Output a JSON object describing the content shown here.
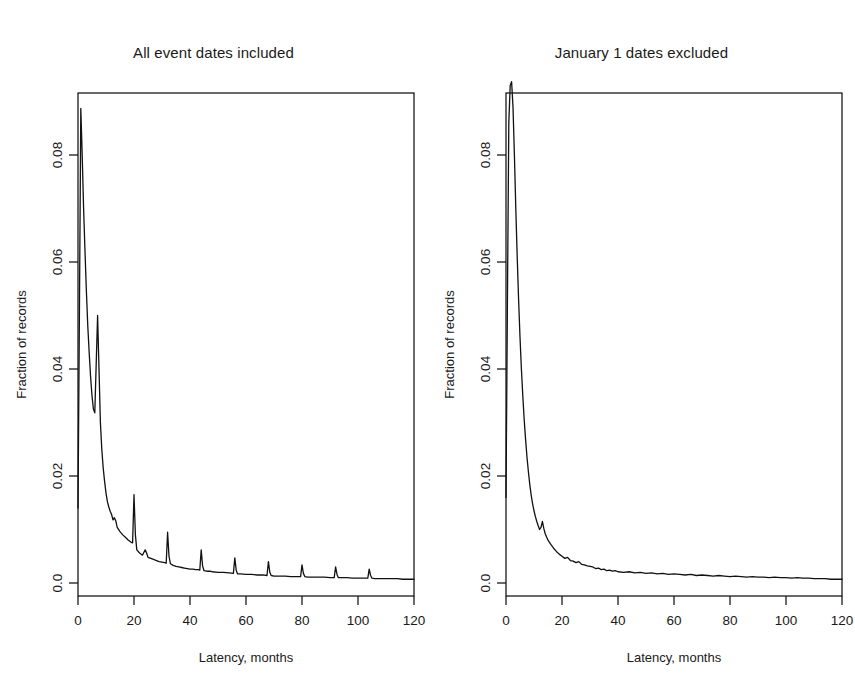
{
  "figure": {
    "background": "#ffffff",
    "line_color": "#111111",
    "text_color": "#1a1a1a"
  },
  "chart_data": [
    {
      "type": "line",
      "title": "All event dates included",
      "xlabel": "Latency, months",
      "ylabel": "Fraction of records",
      "xlim": [
        0,
        120
      ],
      "ylim": [
        0.0,
        0.095
      ],
      "xticks": [
        0,
        20,
        40,
        60,
        80,
        100,
        120
      ],
      "xticklabels": [
        "0",
        "20",
        "40",
        "60",
        "80",
        "100",
        "120"
      ],
      "yticks": [
        0.0,
        0.02,
        0.04,
        0.06,
        0.08
      ],
      "yticklabels": [
        "0.0",
        "0.02",
        "0.04",
        "0.06",
        "0.08"
      ],
      "grid": false,
      "legend": false,
      "legend_position": "none",
      "x": [
        0,
        0.5,
        1,
        1.5,
        2,
        2.5,
        3,
        3.5,
        4,
        4.5,
        5,
        5.5,
        6,
        6.5,
        7,
        7.5,
        8,
        8.5,
        9,
        9.5,
        10,
        10.5,
        11,
        11.5,
        12,
        12.5,
        13,
        13.5,
        14,
        15,
        16,
        17,
        18,
        19,
        19.5,
        20,
        20.5,
        21,
        22,
        23,
        24,
        24.5,
        25,
        26,
        27,
        28,
        29,
        30,
        31,
        31.5,
        32,
        32.5,
        33,
        34,
        35,
        36,
        37,
        38,
        39,
        40,
        41,
        42,
        43,
        43.5,
        44,
        44.5,
        45,
        46,
        47,
        48,
        50,
        52,
        54,
        55.5,
        56,
        56.5,
        57,
        58,
        60,
        62,
        64,
        66,
        67.5,
        68,
        68.5,
        69,
        70,
        72,
        74,
        76,
        78,
        79.5,
        80,
        80.5,
        81,
        82,
        84,
        86,
        88,
        90,
        91.5,
        92,
        92.5,
        93,
        94,
        96,
        98,
        100,
        103.5,
        104,
        104.5,
        105,
        106,
        108,
        110,
        112,
        114,
        116,
        118,
        120
      ],
      "y": [
        0.014,
        0.05,
        0.0887,
        0.08,
        0.07,
        0.062,
        0.0545,
        0.048,
        0.043,
        0.0385,
        0.035,
        0.0325,
        0.0318,
        0.041,
        0.05,
        0.04,
        0.03,
        0.025,
        0.0215,
        0.019,
        0.0168,
        0.0152,
        0.0142,
        0.0134,
        0.0128,
        0.0118,
        0.0122,
        0.0116,
        0.0104,
        0.0096,
        0.009,
        0.0085,
        0.008,
        0.0076,
        0.0075,
        0.0165,
        0.009,
        0.0062,
        0.0056,
        0.0052,
        0.0062,
        0.0056,
        0.0048,
        0.0046,
        0.0044,
        0.0042,
        0.004,
        0.0039,
        0.0038,
        0.0037,
        0.0095,
        0.005,
        0.0036,
        0.0033,
        0.0031,
        0.003,
        0.0029,
        0.0028,
        0.0027,
        0.0026,
        0.0026,
        0.0025,
        0.0025,
        0.0024,
        0.0062,
        0.0032,
        0.0023,
        0.0022,
        0.0022,
        0.0021,
        0.002,
        0.002,
        0.0019,
        0.0018,
        0.0047,
        0.0024,
        0.0017,
        0.0017,
        0.0016,
        0.0016,
        0.0015,
        0.0015,
        0.0014,
        0.004,
        0.002,
        0.0014,
        0.0013,
        0.0013,
        0.0013,
        0.0012,
        0.0012,
        0.0012,
        0.0034,
        0.0018,
        0.0012,
        0.0011,
        0.0011,
        0.0011,
        0.0011,
        0.001,
        0.001,
        0.003,
        0.0016,
        0.001,
        0.001,
        0.001,
        0.0009,
        0.0009,
        0.0009,
        0.0026,
        0.0014,
        0.0009,
        0.0008,
        0.0008,
        0.0008,
        0.0008,
        0.0008,
        0.0007,
        0.0007,
        0.0007
      ]
    },
    {
      "type": "line",
      "title": "January 1 dates excluded",
      "xlabel": "Latency, months",
      "ylabel": "Fraction of records",
      "xlim": [
        0,
        120
      ],
      "ylim": [
        0.0,
        0.095
      ],
      "xticks": [
        0,
        20,
        40,
        60,
        80,
        100,
        120
      ],
      "xticklabels": [
        "0",
        "20",
        "40",
        "60",
        "80",
        "100",
        "120"
      ],
      "yticks": [
        0.0,
        0.02,
        0.04,
        0.06,
        0.08
      ],
      "yticklabels": [
        "0.0",
        "0.02",
        "0.04",
        "0.06",
        "0.08"
      ],
      "grid": false,
      "legend": false,
      "legend_position": "none",
      "x": [
        0,
        0.5,
        1,
        1.5,
        2,
        2.5,
        3,
        3.5,
        4,
        4.5,
        5,
        5.5,
        6,
        6.5,
        7,
        7.5,
        8,
        8.5,
        9,
        9.5,
        10,
        10.5,
        11,
        11.5,
        12,
        12.5,
        13,
        13.5,
        14,
        14.5,
        15,
        16,
        17,
        18,
        19,
        20,
        21,
        22,
        23,
        24,
        25,
        26,
        27,
        28,
        29,
        30,
        31,
        32,
        33,
        34,
        35,
        36,
        37,
        38,
        39,
        40,
        42,
        44,
        46,
        48,
        50,
        52,
        54,
        56,
        58,
        60,
        62,
        64,
        66,
        68,
        70,
        72,
        74,
        76,
        78,
        80,
        82,
        84,
        86,
        88,
        90,
        92,
        94,
        96,
        98,
        100,
        102,
        104,
        106,
        108,
        110,
        112,
        114,
        116,
        118,
        120
      ],
      "y": [
        0.016,
        0.052,
        0.086,
        0.093,
        0.0937,
        0.089,
        0.08,
        0.07,
        0.061,
        0.053,
        0.046,
        0.04,
        0.035,
        0.0305,
        0.0268,
        0.0235,
        0.0208,
        0.0184,
        0.0164,
        0.0148,
        0.0135,
        0.0124,
        0.0115,
        0.0107,
        0.01,
        0.0104,
        0.0115,
        0.0102,
        0.0092,
        0.0086,
        0.008,
        0.0072,
        0.0065,
        0.0059,
        0.0054,
        0.005,
        0.0046,
        0.0048,
        0.0042,
        0.0041,
        0.0038,
        0.004,
        0.0035,
        0.0034,
        0.0032,
        0.0031,
        0.003,
        0.0027,
        0.0028,
        0.0025,
        0.0026,
        0.0023,
        0.0024,
        0.0022,
        0.0023,
        0.0021,
        0.002,
        0.0021,
        0.0019,
        0.002,
        0.0018,
        0.0019,
        0.0017,
        0.0018,
        0.0016,
        0.0017,
        0.0016,
        0.0015,
        0.0016,
        0.0014,
        0.0015,
        0.0014,
        0.0013,
        0.0014,
        0.0013,
        0.0012,
        0.0013,
        0.0012,
        0.0011,
        0.0012,
        0.0011,
        0.0011,
        0.001,
        0.0011,
        0.001,
        0.001,
        0.0009,
        0.001,
        0.0009,
        0.0009,
        0.0008,
        0.0008,
        0.0008,
        0.0007,
        0.0007,
        0.0007
      ]
    }
  ]
}
